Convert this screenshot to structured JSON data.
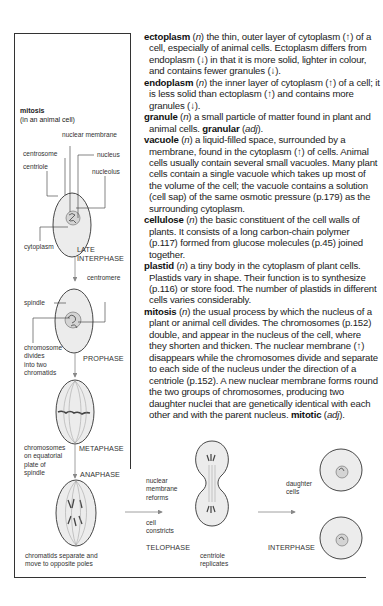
{
  "entries": [
    {
      "headword": "ectoplasm",
      "pos": "n",
      "lines": [
        [
          "the thin, outer layer of cytoplasm (↑) of",
          "a cell, especially of animal cells. Ectoplasm differs",
          "from endoplasm (↓) in that it is more solid, lighter in",
          "colour, and contains fewer granules (↓)."
        ]
      ]
    },
    {
      "headword": "endoplasm",
      "pos": "n",
      "lines": [
        [
          "the inner layer of cytoplasm (↑) of a",
          "cell; it is less solid than ectoplasm (↑) and contains",
          "more granules (↓)."
        ]
      ]
    },
    {
      "headword": "granule",
      "pos": "n",
      "lines": [
        [
          "a small particle of matter found in plant",
          "and animal cells."
        ]
      ],
      "derived": {
        "word": "granular",
        "pos": "adj",
        "suffix": "."
      }
    },
    {
      "headword": "vacuole",
      "pos": "n",
      "lines": [
        [
          "a liquid-filled space, surrounded by a",
          "membrane, found in the cytoplasm (↑) of cells.",
          "Animal cells usually contain several small vacuoles.",
          "Many plant cells contain a single vacuole which",
          "takes up most of the volume of the cell; the vacuole",
          "contains a solution (cell sap) of the same osmotic",
          "pressure (p.179) as the surrounding cytoplasm."
        ]
      ]
    },
    {
      "headword": "cellulose",
      "pos": "n",
      "lines": [
        [
          "the basic constituent of the cell walls of",
          "plants. It consists of a long carbon-chain polymer",
          "(p.117) formed from glucose molecules (p.45)",
          "joined together."
        ]
      ]
    },
    {
      "headword": "plastid",
      "pos": "n",
      "lines": [
        [
          "a tiny body in the cytoplasm of plant cells.",
          "Plastids vary in shape. Their function is to",
          "synthesize (p.116) or store food. The number of",
          "plastids in different cells varies considerably."
        ]
      ]
    },
    {
      "headword": "mitosis",
      "pos": "n",
      "lines": [
        [
          "the usual process by which the nucleus",
          "of a plant or animal cell divides. The chromosomes",
          "(p.152) double, and appear in the nucleus of the",
          "cell, where they shorten and thicken. The nuclear",
          "membrane (↑) disappears while the chromosomes",
          "divide and separate to each side of the nucleus",
          "under the direction of a centriole (p.152). A new",
          "nuclear membrane forms round the two groups of",
          "chromosomes, producing two daughter nuclei that",
          "are genetically identical with each other and with",
          "the parent nucleus."
        ]
      ],
      "derived": {
        "word": "mitotic",
        "pos": "adj",
        "suffix": "."
      }
    }
  ],
  "entry_text": {
    "ectoplasm": "the thin, outer layer of cytoplasm (↑) of a cell, especially of animal cells. Ectoplasm differs from endoplasm (↓) in that it is more solid, lighter in colour, and contains fewer granules (↓).",
    "endoplasm": "the inner layer of cytoplasm (↑) of a cell; it is less solid than ectoplasm (↑) and contains more granules (↓).",
    "granule": "a small particle of matter found in plant and animal cells.",
    "vacuole": "a liquid-filled space, surrounded by a membrane, found in the cytoplasm (↑) of cells. Animal cells usually contain several small vacuoles. Many plant cells contain a single vacuole which takes up most of the volume of the cell; the vacuole contains a solution (cell sap) of the same osmotic pressure (p.179) as the surrounding cytoplasm.",
    "cellulose": "the basic constituent of the cell walls of plants. It consists of a long carbon-chain polymer (p.117) formed from glucose molecules (p.45) joined together.",
    "plastid": "a tiny body in the cytoplasm of plant cells. Plastids vary in shape. Their function is to synthesize (p.116) or store food. The number of plastids in different cells varies considerably.",
    "mitosis": "the usual process by which the nucleus of a plant or animal cell divides. The chromosomes (p.152) double, and appear in the nucleus of the cell, where they shorten and thicken. The nuclear membrane (↑) disappears while the chromosomes divide and separate to each side of the nucleus under the direction of a centriole (p.152). A new nuclear membrane forms round the two groups of chromosomes, producing two daughter nuclei that are genetically identical with each other and with the parent nucleus."
  },
  "diagram": {
    "title": "mitosis",
    "subtitle": "(in an animal cell)",
    "labels": {
      "nuclear_membrane": "nuclear membrane",
      "centrosome": "centrosome",
      "nucleus": "nucleus",
      "centriole": "centriole",
      "nucleolus": "nucleolus",
      "cytoplasm": "cytoplasm",
      "centromere": "centromere",
      "spindle": "spindle",
      "chromosome_divides": [
        "chromosome",
        "divides",
        "into two",
        "chromatids"
      ],
      "chromosomes_equatorial": [
        "chromosomes",
        "on equatorial",
        "plate of",
        "spindle"
      ],
      "chromatids_separate": [
        "chromatids separate and",
        "move to opposite poles"
      ],
      "nuclear_membrane_reforms": [
        "nuclear",
        "membrane",
        "reforms"
      ],
      "cell_constricts": [
        "cell",
        "constricts"
      ],
      "centriole_replicates": [
        "centriole",
        "replicates"
      ],
      "daughter_cells": [
        "daughter",
        "cells"
      ]
    },
    "phases": {
      "late_interphase": [
        "LATE",
        "INTERPHASE"
      ],
      "prophase": "PROPHASE",
      "metaphase": "METAPHASE",
      "anaphase": "ANAPHASE",
      "telophase": "TELOPHASE",
      "interphase": "INTERPHASE"
    }
  }
}
